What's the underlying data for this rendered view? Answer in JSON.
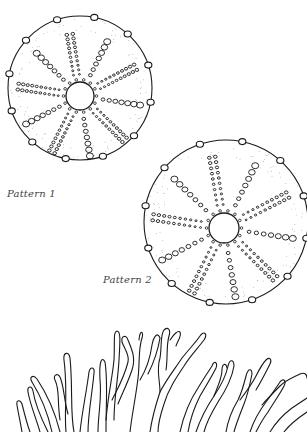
{
  "illustration": {
    "labels": {
      "pattern_1": "Pattern 1",
      "pattern_2": "Pattern 2"
    },
    "figures": [
      {
        "name": "sea-urchin-test-pattern-1",
        "cx": 80,
        "cy": 88,
        "r": 72,
        "inner_cx": 80,
        "inner_cy": 96,
        "inner_r": 14
      },
      {
        "name": "sea-urchin-test-pattern-2",
        "cx": 226,
        "cy": 222,
        "r": 82,
        "inner_cx": 224,
        "inner_cy": 228,
        "inner_r": 15
      },
      {
        "name": "coral-branches"
      }
    ],
    "colors": {
      "ink": "#1a1a1a",
      "label": "#444444",
      "background": "#ffffff"
    }
  }
}
